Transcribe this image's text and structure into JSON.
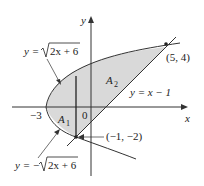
{
  "figure": {
    "axes": {
      "x_label": "x",
      "y_label": "y",
      "origin_label": "0",
      "x_tick_label": "−3"
    },
    "curves": {
      "upper_parabola": "y = √(2x + 6)",
      "upper_parabola_lhs": "y = ",
      "upper_parabola_radicand": "2x + 6",
      "lower_parabola_lhs": "y = −",
      "lower_parabola_radicand": "2x + 6",
      "line": "y = x − 1"
    },
    "regions": {
      "a1": "A",
      "a1_sub": "1",
      "a2": "A",
      "a2_sub": "2"
    },
    "points": {
      "upper_intersection": "(5, 4)",
      "lower_intersection": "(−1, −2)"
    },
    "colors": {
      "shade": "#d9d9d9",
      "stroke": "#333333"
    }
  }
}
